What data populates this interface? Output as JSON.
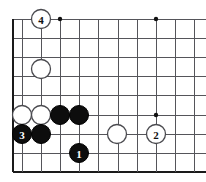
{
  "figure": {
    "name": "go-board-diagram",
    "kind": "go-board",
    "background_color": "#ffffff",
    "line_color": "#55555a",
    "edge_color": "#1a1a1a",
    "black_stone_color": "#0d0d0d",
    "white_stone_color": "#ffffff"
  },
  "board": {
    "left_edge_x": 13,
    "top_line_y": 19,
    "bottom_edge_y": 172,
    "cell_size": 19.2,
    "columns_x": [
      13,
      32.2,
      51.4,
      60.6,
      79.8,
      98.9,
      118.1,
      137.3,
      156.5,
      175.7,
      194.9
    ],
    "rows_y": [
      19,
      38.2,
      57.4,
      76.6,
      95.8,
      115,
      134.2,
      153.4,
      172
    ]
  },
  "grid": {
    "vertical_x": [
      13,
      22,
      41.2,
      60.4,
      79.6,
      98.8,
      118,
      137.2,
      156.4,
      175.6,
      194.8
    ],
    "horizontal_y": [
      19,
      38.2,
      57.4,
      76.6,
      95.8,
      115,
      134.2,
      153.4,
      172
    ]
  },
  "star_points": [
    {
      "name": "star-point-upper-left",
      "cx": 60,
      "cy": 19,
      "r": 2.2
    },
    {
      "name": "star-point-upper-right",
      "cx": 156,
      "cy": 19,
      "r": 2.2
    },
    {
      "name": "star-point-lower-right",
      "cx": 156,
      "cy": 115,
      "r": 2.2
    }
  ],
  "stones": [
    {
      "name": "white-stone-move-4",
      "color": "white",
      "label": "4",
      "cx": 41,
      "cy": 19,
      "r": 9.5
    },
    {
      "name": "white-stone-upper-left",
      "color": "white",
      "label": "",
      "cx": 41,
      "cy": 69,
      "r": 9.5
    },
    {
      "name": "white-stone-left-a",
      "color": "white",
      "label": "",
      "cx": 22,
      "cy": 115,
      "r": 9.5
    },
    {
      "name": "white-stone-left-b",
      "color": "white",
      "label": "",
      "cx": 41,
      "cy": 115,
      "r": 9.5
    },
    {
      "name": "black-stone-center-a",
      "color": "black",
      "label": "",
      "cx": 60,
      "cy": 115,
      "r": 9.5
    },
    {
      "name": "black-stone-center-b",
      "color": "black",
      "label": "",
      "cx": 79,
      "cy": 115,
      "r": 9.5
    },
    {
      "name": "black-stone-move-3",
      "color": "black",
      "label": "3",
      "cx": 22,
      "cy": 134,
      "r": 9.5
    },
    {
      "name": "black-stone-lower-left",
      "color": "black",
      "label": "",
      "cx": 41,
      "cy": 134,
      "r": 9.5
    },
    {
      "name": "white-stone-lower-center",
      "color": "white",
      "label": "",
      "cx": 117,
      "cy": 134,
      "r": 9.5
    },
    {
      "name": "white-stone-move-2",
      "color": "white",
      "label": "2",
      "cx": 156,
      "cy": 134,
      "r": 9.5
    },
    {
      "name": "black-stone-move-1",
      "color": "black",
      "label": "1",
      "cx": 79,
      "cy": 153,
      "r": 9.5
    }
  ],
  "move_numbers": {
    "move_1": "1",
    "move_2": "2",
    "move_3": "3",
    "move_4": "4"
  }
}
